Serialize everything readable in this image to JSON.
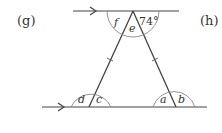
{
  "labels": {
    "left_part": "(g)",
    "right_part": "(h)"
  },
  "angles": {
    "a": "a",
    "b": "b",
    "c": "c",
    "d": "d",
    "e": "e",
    "f": "f",
    "given": "74°"
  },
  "colors": {
    "line": "#444444",
    "arc": "#777777",
    "text": "#333333"
  }
}
